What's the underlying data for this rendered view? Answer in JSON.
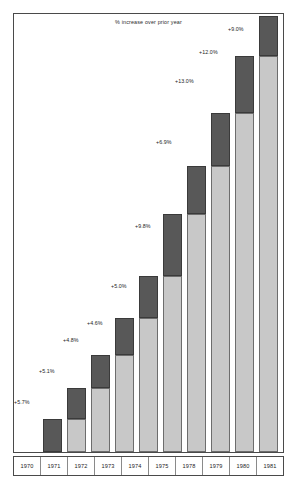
{
  "chart": {
    "title": "% increase over prior year",
    "axis_label_row_name": "year-axis"
  },
  "colors": {
    "base_segment": "#c8c8c8",
    "increase_segment": "#585858",
    "frame": "#4a4a4a",
    "text": "#1c1c1c",
    "background": "#ffffff"
  },
  "chart_data": {
    "type": "bar",
    "title": "% increase over prior year",
    "xlabel": "",
    "ylabel": "",
    "grid": false,
    "legend": "none",
    "stacked": true,
    "note": "Each bar is cumulative: light gray lower segment equals the prior year's total level, dark gray upper cap is that year's increase. Labels give the percent increase over the prior year.",
    "categories": [
      "1970",
      "1971",
      "1972",
      "1973",
      "1974",
      "1975",
      "1978",
      "1979",
      "1980",
      "1981"
    ],
    "labels": [
      "+5.7%",
      "+5.1%",
      "+4.8%",
      "+4.6%",
      "+5.0%",
      "+9.8%",
      "+6.9%",
      "+13.0%",
      "+12.0%",
      "+9.0%"
    ],
    "percent_increase": [
      5.7,
      5.1,
      4.8,
      4.6,
      5.0,
      9.8,
      6.9,
      13.0,
      12.0,
      9.0
    ],
    "series": [
      {
        "name": "prior year level",
        "values": [
          0,
          33,
          64,
          97,
          134,
          176,
          238,
          286,
          339,
          396
        ]
      },
      {
        "name": "increase",
        "values": [
          33,
          31,
          33,
          37,
          42,
          62,
          48,
          53,
          57,
          40
        ]
      }
    ],
    "bar_totals": [
      33,
      64,
      97,
      134,
      176,
      238,
      286,
      339,
      396,
      436
    ],
    "ylim": [
      0,
      440
    ]
  },
  "bars": [
    {
      "year": "1970",
      "label": "+5.7%",
      "x": 42,
      "width": 19,
      "base_h": 0,
      "inc_h": 33,
      "label_x": 13,
      "label_y": 398
    },
    {
      "year": "1971",
      "label": "+5.1%",
      "x": 66,
      "width": 19,
      "base_h": 33,
      "inc_h": 31,
      "label_x": 38,
      "label_y": 367
    },
    {
      "year": "1972",
      "label": "+4.8%",
      "x": 90,
      "width": 19,
      "base_h": 64,
      "inc_h": 33,
      "label_x": 62,
      "label_y": 336
    },
    {
      "year": "1973",
      "label": "+4.6%",
      "x": 114,
      "width": 19,
      "base_h": 97,
      "inc_h": 37,
      "label_x": 86,
      "label_y": 319
    },
    {
      "year": "1974",
      "label": "+5.0%",
      "x": 138,
      "width": 19,
      "base_h": 134,
      "inc_h": 42,
      "label_x": 110,
      "label_y": 282
    },
    {
      "year": "1975",
      "label": "+9.8%",
      "x": 162,
      "width": 19,
      "base_h": 176,
      "inc_h": 62,
      "label_x": 134,
      "label_y": 222
    },
    {
      "year": "1978",
      "label": "+6.9%",
      "x": 186,
      "width": 19,
      "base_h": 238,
      "inc_h": 48,
      "label_x": 155,
      "label_y": 138
    },
    {
      "year": "1979",
      "label": "+13.0%",
      "x": 210,
      "width": 19,
      "base_h": 286,
      "inc_h": 53,
      "label_x": 174,
      "label_y": 77
    },
    {
      "year": "1980",
      "label": "+12.0%",
      "x": 234,
      "width": 19,
      "base_h": 339,
      "inc_h": 57,
      "label_x": 198,
      "label_y": 48
    },
    {
      "year": "1981",
      "label": "+9.0%",
      "x": 258,
      "width": 19,
      "base_h": 396,
      "inc_h": 40,
      "label_x": 227,
      "label_y": 25
    }
  ],
  "axis": {
    "years": [
      {
        "label": "1970",
        "x": 0,
        "w": 27
      },
      {
        "label": "1971",
        "x": 27,
        "w": 27
      },
      {
        "label": "1972",
        "x": 54,
        "w": 27
      },
      {
        "label": "1973",
        "x": 81,
        "w": 27
      },
      {
        "label": "1974",
        "x": 108,
        "w": 27
      },
      {
        "label": "1975",
        "x": 135,
        "w": 27
      },
      {
        "label": "1978",
        "x": 162,
        "w": 27
      },
      {
        "label": "1979",
        "x": 189,
        "w": 27
      },
      {
        "label": "1980",
        "x": 216,
        "w": 27
      },
      {
        "label": "1981",
        "x": 243,
        "w": 26
      }
    ]
  }
}
